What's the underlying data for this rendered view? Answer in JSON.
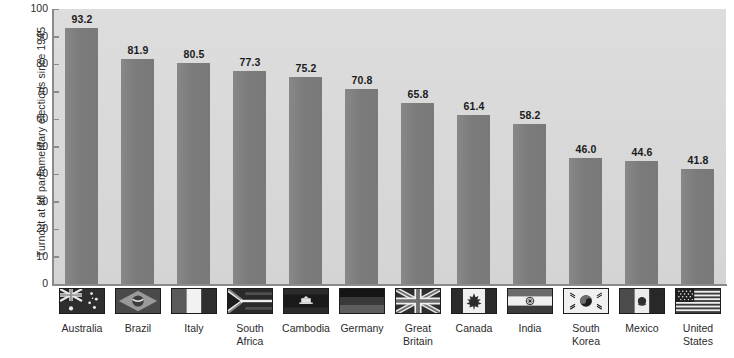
{
  "chart_data": {
    "type": "bar",
    "title": "",
    "xlabel": "",
    "ylabel": "Turnout at all parliamentary elections since 1945",
    "ylim": [
      0,
      100
    ],
    "ytick_values": [
      100,
      90,
      80,
      70,
      60,
      50,
      40,
      30,
      20,
      10,
      0
    ],
    "ytick_labels": [
      "100",
      "90",
      "80",
      "70",
      "60",
      "50",
      "40",
      "30",
      "20",
      "10",
      "0"
    ],
    "grid": false,
    "legend": "none",
    "value_label_format": "one-decimal",
    "categories": [
      "Australia",
      "Brazil",
      "Italy",
      "South Africa",
      "Cambodia",
      "Germany",
      "Great Britain",
      "Canada",
      "India",
      "South Korea",
      "Mexico",
      "United States"
    ],
    "values": [
      93.2,
      81.9,
      80.5,
      77.3,
      75.2,
      70.8,
      65.8,
      61.4,
      58.2,
      46.0,
      44.6,
      41.8
    ],
    "value_labels": [
      "93.2",
      "81.9",
      "80.5",
      "77.3",
      "75.2",
      "70.8",
      "65.8",
      "61.4",
      "58.2",
      "46.0",
      "44.6",
      "41.8"
    ],
    "category_lines": [
      [
        "Australia",
        ""
      ],
      [
        "Brazil",
        ""
      ],
      [
        "Italy",
        ""
      ],
      [
        "South",
        "Africa"
      ],
      [
        "Cambodia",
        ""
      ],
      [
        "Germany",
        ""
      ],
      [
        "Great",
        "Britain"
      ],
      [
        "Canada",
        ""
      ],
      [
        "India",
        ""
      ],
      [
        "South",
        "Korea"
      ],
      [
        "Mexico",
        ""
      ],
      [
        "United",
        "States"
      ]
    ],
    "flag_icons": [
      "flag-australia-icon",
      "flag-brazil-icon",
      "flag-italy-icon",
      "flag-south-africa-icon",
      "flag-cambodia-icon",
      "flag-germany-icon",
      "flag-great-britain-icon",
      "flag-canada-icon",
      "flag-india-icon",
      "flag-south-korea-icon",
      "flag-mexico-icon",
      "flag-united-states-icon"
    ]
  },
  "colors": {
    "bar": "#7e7e7e",
    "plot_background": "#d8d8d8",
    "page_background": "#ffffff",
    "axis": "#8b8b8b",
    "text": "#2b2b2b",
    "value_text": "#1b1b1b"
  }
}
